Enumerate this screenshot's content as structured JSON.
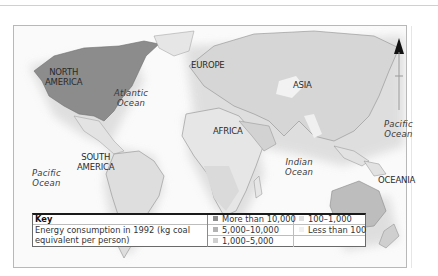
{
  "map": {
    "regions": [
      {
        "id": "north-america",
        "label_lines": [
          "NORTH",
          "AMERICA"
        ],
        "category": "More than 10,000"
      },
      {
        "id": "europe",
        "label_lines": [
          "EUROPE"
        ],
        "category": "1,000–5,000"
      },
      {
        "id": "asia",
        "label_lines": [
          "ASIA"
        ],
        "category": "1,000–5,000"
      },
      {
        "id": "africa",
        "label_lines": [
          "AFRICA"
        ],
        "category": "100–1,000"
      },
      {
        "id": "south-america",
        "label_lines": [
          "SOUTH",
          "AMERICA"
        ],
        "category": "1,000–5,000"
      },
      {
        "id": "oceania",
        "label_lines": [
          "OCEANIA"
        ],
        "category": "5,000–10,000"
      }
    ],
    "oceans": [
      {
        "id": "atlantic",
        "lines": [
          "Atlantic",
          "Ocean"
        ]
      },
      {
        "id": "pacific-west",
        "lines": [
          "Pacific",
          "Ocean"
        ]
      },
      {
        "id": "pacific-east",
        "lines": [
          "Pacific",
          "Ocean"
        ]
      },
      {
        "id": "indian",
        "lines": [
          "Indian",
          "Ocean"
        ]
      }
    ],
    "north_arrow": "north-arrow-icon"
  },
  "key": {
    "title": "Key",
    "description_lines": [
      "Energy consumption in 1992 (kg coal",
      "equivalent per person)"
    ],
    "items": [
      {
        "label": "More than 10,000",
        "color": "#8c8c8c"
      },
      {
        "label": "5,000–10,000",
        "color": "#b3b3b3"
      },
      {
        "label": "1,000–5,000",
        "color": "#cfcfcf"
      },
      {
        "label": "100–1,000",
        "color": "#e0e0e0"
      },
      {
        "label": "Less than 100",
        "color": "#f0f0f0"
      }
    ]
  }
}
